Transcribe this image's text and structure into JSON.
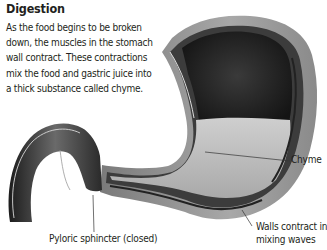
{
  "title": "Digestion",
  "paragraph_lines": [
    "As the food begins to be broken",
    "down, the muscles in the stomach",
    "wall contract. These contractions",
    "mix the food and gastric juice into",
    "a thick substance called chyme."
  ],
  "labels": {
    "chyme": "Chyme",
    "walls_line1": "Walls contract in",
    "walls_line2": "mixing waves",
    "pyloric": "Pyloric sphincter (closed)"
  },
  "colors": {
    "text": "#231f20",
    "dark_interior": "#1e1e1e",
    "chyme_fill": "#b8b8b8",
    "outer_wall": "#9a9a9a"
  }
}
